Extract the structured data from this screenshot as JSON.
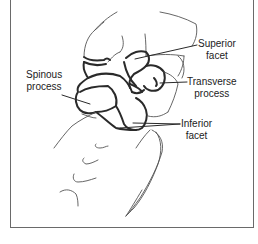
{
  "figure": {
    "labels": {
      "superior_facet": {
        "line1": "Superior",
        "line2": "facet"
      },
      "spinous_process": {
        "line1": "Spinous",
        "line2": "process"
      },
      "transverse_process": {
        "line1": "Transverse",
        "line2": "process"
      },
      "inferior_facet": {
        "line1": "Inferior",
        "line2": "facet"
      }
    },
    "colors": {
      "bold_outline": "#2a2a2a",
      "thin_outline": "#555555",
      "frame": "#6a6a6a",
      "text": "#222222"
    }
  }
}
